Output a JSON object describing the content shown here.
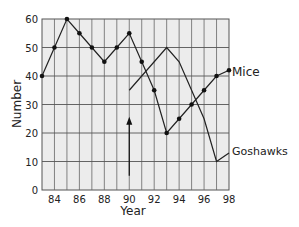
{
  "chart_data": {
    "type": "line",
    "title": "",
    "xlabel": "Year",
    "ylabel": "Number",
    "xlim": [
      83,
      98
    ],
    "ylim": [
      0,
      60
    ],
    "x_ticks": [
      84,
      86,
      88,
      90,
      92,
      94,
      96,
      98
    ],
    "y_ticks": [
      0,
      10,
      20,
      30,
      40,
      50,
      60
    ],
    "grid": true,
    "legend": "inline labels at line ends",
    "series": [
      {
        "name": "Mice",
        "markers": true,
        "x": [
          83,
          84,
          85,
          86,
          87,
          88,
          89,
          90,
          91,
          92,
          93,
          94,
          95,
          96,
          97,
          98
        ],
        "values": [
          40,
          50,
          60,
          55,
          50,
          45,
          50,
          55,
          45,
          35,
          20,
          25,
          30,
          35,
          40,
          42
        ]
      },
      {
        "name": "Goshawks",
        "markers": false,
        "x": [
          90,
          93,
          94,
          96,
          97,
          98
        ],
        "values": [
          35,
          50,
          45,
          25,
          10,
          13
        ]
      }
    ],
    "annotations": [
      {
        "type": "arrow",
        "x": 90,
        "from_y": 5,
        "to_y": 25,
        "label": ""
      }
    ]
  },
  "labels": {
    "mice": "Mice",
    "goshawks": "Goshawks",
    "xlabel": "Year",
    "ylabel": "Number"
  }
}
